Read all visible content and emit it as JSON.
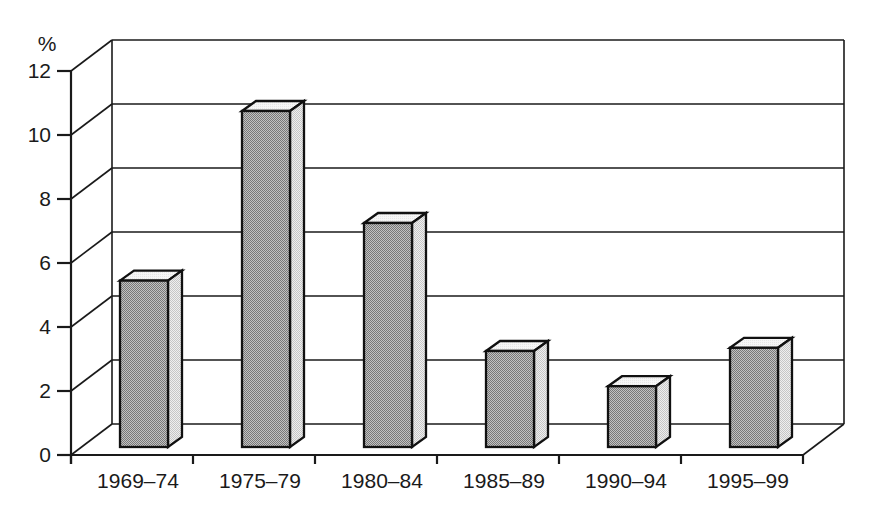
{
  "chart_data": {
    "type": "bar",
    "style": "3d-column",
    "title": "",
    "xlabel": "",
    "ylabel": "%",
    "categories": [
      "1969–74",
      "1975–79",
      "1980–84",
      "1985–89",
      "1990–94",
      "1995–99"
    ],
    "values": [
      5.2,
      10.5,
      7.0,
      3.0,
      1.9,
      3.1
    ],
    "yticks": [
      0,
      2,
      4,
      6,
      8,
      10,
      12
    ],
    "ylim": [
      0,
      12
    ],
    "grid": "horizontal-back-wall",
    "legend": "none",
    "colors": {
      "line": "#1a1a1a",
      "bar_outline": "#111111",
      "bar_front": "#9d9d9d",
      "bar_side": "#dbdbdb",
      "bar_top": "#f1f1f1",
      "background": "#ffffff"
    }
  }
}
